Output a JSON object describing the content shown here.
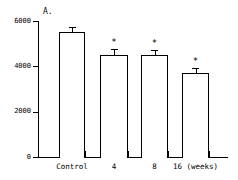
{
  "chart_data": {
    "type": "bar",
    "title": "A.",
    "xlabel": "",
    "ylabel": "",
    "categories": [
      "Control",
      "4",
      "8",
      "16 (weeks)"
    ],
    "values": [
      5500,
      4500,
      4500,
      3700
    ],
    "errors": [
      220,
      260,
      230,
      230
    ],
    "significance": [
      "",
      "*",
      "*",
      "*"
    ],
    "ylim": [
      0,
      6000
    ],
    "ytick_values": [
      0,
      2000,
      4000,
      6000
    ],
    "ytick_labels": [
      "0",
      "2000",
      "4000",
      "6000"
    ],
    "grid": false,
    "legend": false,
    "bar_fill": "#ffffff",
    "bar_edge": "#000000"
  },
  "panel": {
    "label": "A."
  },
  "axis": {
    "y": {
      "ticks": [
        {
          "label": "6000",
          "value": 6000
        },
        {
          "label": "4000",
          "value": 4000
        },
        {
          "label": "2000",
          "value": 2000
        },
        {
          "label": "0",
          "value": 0
        }
      ]
    },
    "x": {
      "ticks": [
        {
          "label": "Control"
        },
        {
          "label": "4"
        },
        {
          "label": "8"
        },
        {
          "label": "16 (weeks)"
        }
      ]
    }
  },
  "marks": {
    "asterisk": "*"
  }
}
